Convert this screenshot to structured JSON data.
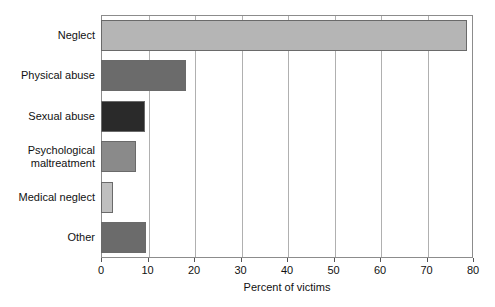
{
  "chart_data": {
    "type": "bar",
    "orientation": "horizontal",
    "title": "",
    "xlabel": "Percent of victims",
    "ylabel": "",
    "xlim": [
      0,
      80
    ],
    "xticks": [
      0,
      10,
      20,
      30,
      40,
      50,
      60,
      70,
      80
    ],
    "xtick_labels": [
      "0",
      "10",
      "20",
      "30",
      "40",
      "50",
      "60",
      "70",
      "80"
    ],
    "grid": "vertical",
    "legend": "none",
    "categories": [
      "Neglect",
      "Physical abuse",
      "Sexual abuse",
      "Psychological\nmaltreatment",
      "Medical neglect",
      "Other"
    ],
    "values": [
      78.8,
      18.2,
      9.4,
      7.6,
      2.5,
      9.7
    ],
    "bar_colors": [
      "#b5b5b5",
      "#6b6b6b",
      "#2a2a2a",
      "#8a8a8a",
      "#bfbfbf",
      "#6b6b6b"
    ],
    "bar_edge_color": "#6a6a6a",
    "axis_color": "#8c8c8c",
    "grid_color": "#b0b0b0",
    "background": "#ffffff"
  }
}
